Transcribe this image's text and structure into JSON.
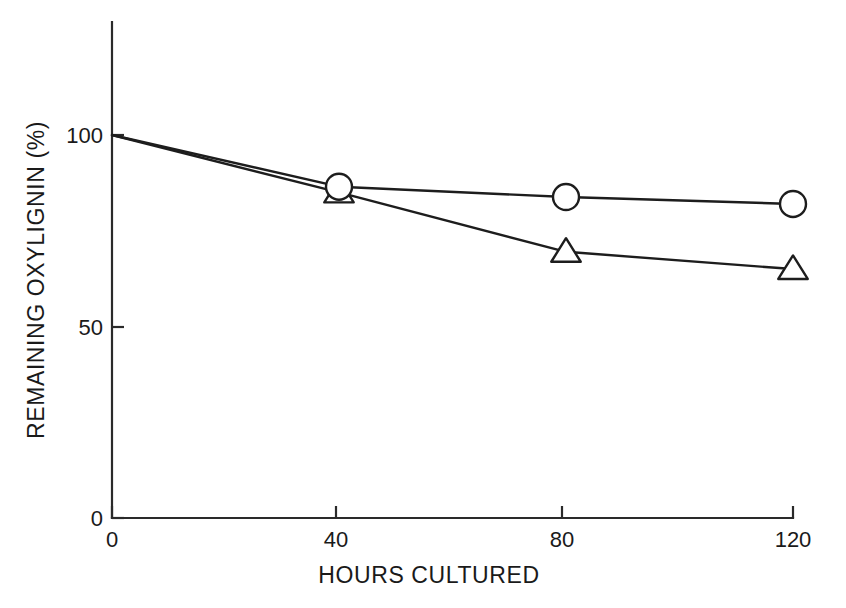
{
  "chart_data": {
    "type": "line",
    "title": "",
    "xlabel": "HOURS CULTURED",
    "ylabel": "REMAINING OXYLIGNIN (%)",
    "x": [
      0,
      40,
      80,
      120
    ],
    "xlim": [
      0,
      120
    ],
    "ylim": [
      0,
      112
    ],
    "xticks": [
      0,
      40,
      80,
      120
    ],
    "xtick_labels": [
      "0",
      "40",
      "80",
      "120"
    ],
    "yticks": [
      0,
      50,
      100
    ],
    "ytick_labels": [
      "0",
      "50",
      "100"
    ],
    "grid": false,
    "legend": "none",
    "series": [
      {
        "name": "circle-series",
        "marker": "circle",
        "values": [
          100,
          86.5,
          83.8,
          82
        ]
      },
      {
        "name": "triangle-series",
        "marker": "triangle",
        "values": [
          100,
          85,
          69.5,
          65
        ]
      }
    ],
    "colors": {
      "line": "#1d1d1d",
      "marker_fill": "#ffffff",
      "axis": "#2a2a2a",
      "background": "#ffffff"
    }
  },
  "axes": {
    "x_axis_title": "HOURS CULTURED",
    "y_axis_title": "REMAINING OXYLIGNIN (%)",
    "x_tick_0": "0",
    "x_tick_1": "40",
    "x_tick_2": "80",
    "x_tick_3": "120",
    "y_tick_0": "0",
    "y_tick_1": "50",
    "y_tick_2": "100"
  }
}
